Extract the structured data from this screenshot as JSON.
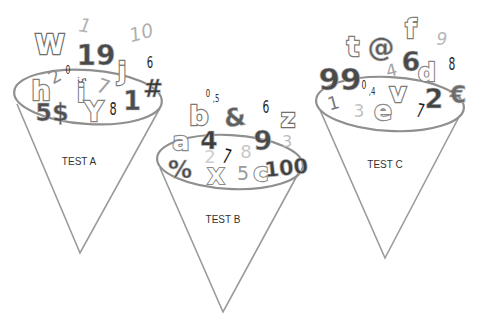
{
  "diagram": {
    "title": "",
    "background": "#ffffff",
    "line_color": "#9a9a9a",
    "cones": [
      {
        "id": "A",
        "label": "TEST A",
        "rim": {
          "cx": 88,
          "cy": 97,
          "rx": 74,
          "ry": 27,
          "rotate": 4
        },
        "left_top": [
          17,
          104
        ],
        "right_top": [
          160,
          108
        ],
        "apex": [
          80,
          253
        ],
        "label_pos": [
          79,
          165
        ],
        "glyphs": [
          {
            "t": "W",
            "x": 50,
            "y": 54,
            "size": 27,
            "style": "outline",
            "color": "#6d6d6d",
            "rot": 0
          },
          {
            "t": "1",
            "x": 84,
            "y": 32,
            "size": 19,
            "style": "italic-light",
            "color": "#b5b5b5",
            "rot": 10
          },
          {
            "t": "10",
            "x": 143,
            "y": 39,
            "size": 19,
            "style": "italic-light",
            "color": "#b0b0b0",
            "rot": -15
          },
          {
            "t": "19",
            "x": 96,
            "y": 65,
            "size": 28,
            "style": "solid",
            "color": "#4a4a4a",
            "rot": 0
          },
          {
            "t": "6",
            "x": 150,
            "y": 68,
            "size": 16,
            "style": "narrow",
            "color": "#1e1e1e",
            "rot": 0
          },
          {
            "t": "2",
            "x": 58,
            "y": 82,
            "size": 18,
            "style": "light",
            "color": "#8c8c8c",
            "rot": -30
          },
          {
            "t": "0",
            "x": 68,
            "y": 74,
            "size": 12,
            "style": "narrow",
            "color": "#222222",
            "rot": 0
          },
          {
            "t": ".5",
            "x": 78,
            "y": 80,
            "size": 11,
            "style": "narrow",
            "color": "#333333",
            "rot": 80
          },
          {
            "t": "7",
            "x": 101,
            "y": 93,
            "size": 20,
            "style": "light",
            "color": "#a0a0a0",
            "rot": 20
          },
          {
            "t": "j",
            "x": 122,
            "y": 80,
            "size": 25,
            "style": "outline",
            "color": "#7a7a7a",
            "rot": 0
          },
          {
            "t": "h",
            "x": 41,
            "y": 100,
            "size": 27,
            "style": "outline",
            "color": "#7f7f7f",
            "rot": 0
          },
          {
            "t": "i",
            "x": 81,
            "y": 102,
            "size": 24,
            "style": "outline",
            "color": "#7d7d7d",
            "rot": 0
          },
          {
            "t": "#",
            "x": 153,
            "y": 97,
            "size": 24,
            "style": "solid",
            "color": "#3a3a3a",
            "rot": 0
          },
          {
            "t": "1",
            "x": 132,
            "y": 110,
            "size": 26,
            "style": "solid",
            "color": "#4c4c4c",
            "rot": 0
          },
          {
            "t": "8",
            "x": 113,
            "y": 115,
            "size": 18,
            "style": "narrow",
            "color": "#1c1c1c",
            "rot": 0
          },
          {
            "t": "Y",
            "x": 94,
            "y": 121,
            "size": 26,
            "style": "outline",
            "color": "#858585",
            "rot": 0
          },
          {
            "t": "5$",
            "x": 52,
            "y": 121,
            "size": 24,
            "style": "solid",
            "color": "#505050",
            "rot": 0
          }
        ]
      },
      {
        "id": "B",
        "label": "TEST B",
        "rim": {
          "cx": 230,
          "cy": 162,
          "rx": 73,
          "ry": 27,
          "rotate": 3
        },
        "left_top": [
          160,
          168
        ],
        "right_top": [
          299,
          172
        ],
        "apex": [
          223,
          312
        ],
        "label_pos": [
          223,
          223
        ],
        "glyphs": [
          {
            "t": "0",
            "x": 208,
            "y": 97,
            "size": 11,
            "style": "narrow",
            "color": "#222222",
            "rot": 0
          },
          {
            "t": ",5",
            "x": 216,
            "y": 102,
            "size": 11,
            "style": "narrow",
            "color": "#333333",
            "rot": 0
          },
          {
            "t": "b",
            "x": 199,
            "y": 125,
            "size": 27,
            "style": "outline",
            "color": "#7a7a7a",
            "rot": 0
          },
          {
            "t": "&",
            "x": 236,
            "y": 126,
            "size": 25,
            "style": "solid",
            "color": "#5e5e5e",
            "rot": -8
          },
          {
            "t": "6",
            "x": 266,
            "y": 113,
            "size": 17,
            "style": "narrow",
            "color": "#1e1e1e",
            "rot": 0
          },
          {
            "t": "z",
            "x": 288,
            "y": 127,
            "size": 25,
            "style": "outline",
            "color": "#6e6e6e",
            "rot": 0
          },
          {
            "t": "a",
            "x": 181,
            "y": 150,
            "size": 25,
            "style": "outline",
            "color": "#8a8a8a",
            "rot": 0
          },
          {
            "t": "4",
            "x": 209,
            "y": 149,
            "size": 25,
            "style": "solid",
            "color": "#3d3d3d",
            "rot": 0
          },
          {
            "t": "9",
            "x": 263,
            "y": 150,
            "size": 27,
            "style": "solid",
            "color": "#4a4a4a",
            "rot": 0
          },
          {
            "t": "3",
            "x": 287,
            "y": 147,
            "size": 16,
            "style": "light",
            "color": "#bdbdbd",
            "rot": 0
          },
          {
            "t": "2",
            "x": 210,
            "y": 163,
            "size": 18,
            "style": "light",
            "color": "#cfcfcf",
            "rot": 0
          },
          {
            "t": "7",
            "x": 225,
            "y": 163,
            "size": 20,
            "style": "narrow",
            "color": "#1a1a1a",
            "rot": 15
          },
          {
            "t": "8",
            "x": 246,
            "y": 158,
            "size": 18,
            "style": "light",
            "color": "#c8c8c8",
            "rot": 0
          },
          {
            "t": "%",
            "x": 180,
            "y": 178,
            "size": 24,
            "style": "solid",
            "color": "#4a4a4a",
            "rot": 0
          },
          {
            "t": "X",
            "x": 216,
            "y": 184,
            "size": 22,
            "style": "outline",
            "color": "#8a8a8a",
            "rot": 0
          },
          {
            "t": "5",
            "x": 243,
            "y": 180,
            "size": 19,
            "style": "light",
            "color": "#9a9a9a",
            "rot": 0
          },
          {
            "t": "c",
            "x": 261,
            "y": 181,
            "size": 25,
            "style": "outline",
            "color": "#8c8c8c",
            "rot": 0
          },
          {
            "t": "100",
            "x": 287,
            "y": 175,
            "size": 21,
            "style": "solid",
            "color": "#404040",
            "rot": -6
          }
        ]
      },
      {
        "id": "C",
        "label": "TEST C",
        "rim": {
          "cx": 390,
          "cy": 104,
          "rx": 74,
          "ry": 27,
          "rotate": 3
        },
        "left_top": [
          320,
          110
        ],
        "right_top": [
          460,
          115
        ],
        "apex": [
          385,
          258
        ],
        "label_pos": [
          385,
          168
        ],
        "glyphs": [
          {
            "t": "f",
            "x": 411,
            "y": 38,
            "size": 26,
            "style": "outline",
            "color": "#7e7e7e",
            "rot": 0
          },
          {
            "t": "9",
            "x": 442,
            "y": 45,
            "size": 17,
            "style": "italic-light",
            "color": "#b8b8b8",
            "rot": 0
          },
          {
            "t": "t",
            "x": 353,
            "y": 56,
            "size": 26,
            "style": "outline",
            "color": "#7a7a7a",
            "rot": 0
          },
          {
            "t": "@",
            "x": 381,
            "y": 56,
            "size": 27,
            "style": "solid",
            "color": "#5c5c5c",
            "rot": 0
          },
          {
            "t": "4",
            "x": 393,
            "y": 76,
            "size": 17,
            "style": "light",
            "color": "#a3a3a3",
            "rot": -15
          },
          {
            "t": "6",
            "x": 411,
            "y": 71,
            "size": 27,
            "style": "solid",
            "color": "#4a4a4a",
            "rot": 0
          },
          {
            "t": "d",
            "x": 427,
            "y": 81,
            "size": 25,
            "style": "outline",
            "color": "#858585",
            "rot": 0
          },
          {
            "t": "8",
            "x": 452,
            "y": 70,
            "size": 17,
            "style": "narrow",
            "color": "#1c1c1c",
            "rot": 0
          },
          {
            "t": "99",
            "x": 340,
            "y": 90,
            "size": 31,
            "style": "solid",
            "color": "#4a4a4a",
            "rot": 0
          },
          {
            "t": "0",
            "x": 364,
            "y": 89,
            "size": 12,
            "style": "narrow",
            "color": "#222222",
            "rot": 0
          },
          {
            "t": ",4",
            "x": 372,
            "y": 95,
            "size": 11,
            "style": "narrow",
            "color": "#333333",
            "rot": 0
          },
          {
            "t": "v",
            "x": 398,
            "y": 102,
            "size": 26,
            "style": "outline",
            "color": "#7a7a7a",
            "rot": 0
          },
          {
            "t": "€",
            "x": 458,
            "y": 103,
            "size": 24,
            "style": "solid",
            "color": "#6c6c6c",
            "rot": 0
          },
          {
            "t": "1",
            "x": 335,
            "y": 109,
            "size": 18,
            "style": "light",
            "color": "#7a7a7a",
            "rot": -15
          },
          {
            "t": "3",
            "x": 359,
            "y": 117,
            "size": 17,
            "style": "light",
            "color": "#c2c2c2",
            "rot": 0
          },
          {
            "t": "e",
            "x": 383,
            "y": 120,
            "size": 26,
            "style": "outline",
            "color": "#8a8a8a",
            "rot": 0
          },
          {
            "t": "7",
            "x": 419,
            "y": 117,
            "size": 19,
            "style": "narrow",
            "color": "#1c1c1c",
            "rot": 12
          },
          {
            "t": "2",
            "x": 434,
            "y": 108,
            "size": 27,
            "style": "solid",
            "color": "#434343",
            "rot": 0
          }
        ]
      }
    ]
  }
}
